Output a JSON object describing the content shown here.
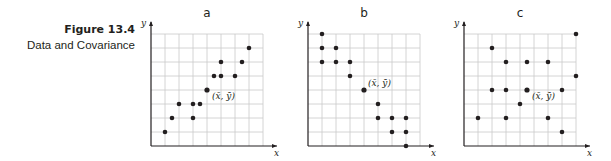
{
  "caption": {
    "figure": "Figure 13.4",
    "title": "Data and Covariance"
  },
  "axes": {
    "x_label": "x",
    "y_label": "y"
  },
  "mean_label": "(x̄, ȳ)",
  "colors": {
    "grid": "#c9c9c9",
    "axis": "#231f20",
    "point": "#231f20"
  },
  "chart_data": [
    {
      "type": "scatter",
      "title": "a",
      "xlabel": "x",
      "ylabel": "y",
      "grid": true,
      "xlim": [
        0,
        8
      ],
      "ylim": [
        0,
        8
      ],
      "points": [
        [
          1,
          1
        ],
        [
          1.5,
          2
        ],
        [
          2,
          3
        ],
        [
          3,
          3
        ],
        [
          3.5,
          3
        ],
        [
          3,
          2
        ],
        [
          4.5,
          5
        ],
        [
          5,
          5
        ],
        [
          6,
          5
        ],
        [
          5,
          6
        ],
        [
          6.5,
          6
        ],
        [
          7,
          7
        ]
      ],
      "mean": [
        4,
        4
      ],
      "mean_label": "(x̄, ȳ)",
      "correlation": "positive"
    },
    {
      "type": "scatter",
      "title": "b",
      "xlabel": "x",
      "ylabel": "y",
      "grid": true,
      "xlim": [
        0,
        8
      ],
      "ylim": [
        0,
        8
      ],
      "points": [
        [
          1,
          8
        ],
        [
          1,
          7
        ],
        [
          2,
          7
        ],
        [
          1,
          6
        ],
        [
          2,
          6
        ],
        [
          3,
          6
        ],
        [
          3,
          5
        ],
        [
          5,
          3
        ],
        [
          5,
          2
        ],
        [
          6,
          2
        ],
        [
          7,
          2
        ],
        [
          6,
          1
        ],
        [
          7,
          1
        ],
        [
          7,
          0
        ]
      ],
      "mean": [
        4,
        4
      ],
      "mean_label": "(x̄, ȳ)",
      "correlation": "negative"
    },
    {
      "type": "scatter",
      "title": "c",
      "xlabel": "x",
      "ylabel": "y",
      "grid": true,
      "xlim": [
        0,
        8
      ],
      "ylim": [
        0,
        8
      ],
      "points": [
        [
          8,
          8
        ],
        [
          2,
          7
        ],
        [
          3,
          6
        ],
        [
          4.5,
          6
        ],
        [
          6,
          6
        ],
        [
          8,
          5
        ],
        [
          2,
          4
        ],
        [
          3,
          4
        ],
        [
          7,
          4
        ],
        [
          4,
          3
        ],
        [
          1,
          2
        ],
        [
          3,
          2
        ],
        [
          6,
          2
        ],
        [
          7,
          1
        ]
      ],
      "mean": [
        4.5,
        4
      ],
      "mean_label": "(x̄, ȳ)",
      "correlation": "none"
    }
  ]
}
